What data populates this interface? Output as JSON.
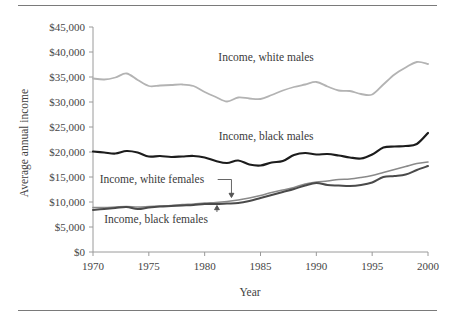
{
  "figure": {
    "name": "average-annual-income-by-race-and-sex-line-chart",
    "rule_color": "#7a7a7a"
  },
  "chart_data": {
    "type": "line",
    "title": "",
    "xlabel": "Year",
    "ylabel": "Average annual income",
    "xlim": [
      1970,
      2000
    ],
    "ylim": [
      0,
      45000
    ],
    "grid": false,
    "legend_position": "inline-annotations",
    "x_tick_labels": [
      "1970",
      "1975",
      "1980",
      "1985",
      "1990",
      "1995",
      "2000"
    ],
    "x_ticks": [
      1970,
      1975,
      1980,
      1985,
      1990,
      1995,
      2000
    ],
    "y_tick_labels": [
      "$0",
      "$5,000",
      "$10,000",
      "$15,000",
      "$20,000",
      "$25,000",
      "$30,000",
      "$35,000",
      "$40,000",
      "$45,000"
    ],
    "y_ticks": [
      0,
      5000,
      10000,
      15000,
      20000,
      25000,
      30000,
      35000,
      40000,
      45000
    ],
    "x": [
      1970,
      1971,
      1972,
      1973,
      1974,
      1975,
      1976,
      1977,
      1978,
      1979,
      1980,
      1981,
      1982,
      1983,
      1984,
      1985,
      1986,
      1987,
      1988,
      1989,
      1990,
      1991,
      1992,
      1993,
      1994,
      1995,
      1996,
      1997,
      1998,
      1999,
      2000
    ],
    "series": [
      {
        "name": "Income, white males",
        "color": "#b3b3b3",
        "width": 1.8,
        "label": "Income, white males",
        "values": [
          34700,
          34500,
          34900,
          35700,
          34400,
          33200,
          33300,
          33400,
          33500,
          33200,
          32000,
          31000,
          30100,
          30900,
          30700,
          30600,
          31400,
          32300,
          33000,
          33500,
          34000,
          33100,
          32300,
          32200,
          31600,
          31500,
          33500,
          35500,
          36900,
          38000,
          37600
        ]
      },
      {
        "name": "Income, black males",
        "color": "#1c1c1c",
        "width": 2.2,
        "label": "Income, black males",
        "values": [
          20100,
          19900,
          19700,
          20200,
          19900,
          19100,
          19200,
          19000,
          19100,
          19200,
          18900,
          18200,
          17800,
          18300,
          17500,
          17300,
          17900,
          18200,
          19400,
          19800,
          19500,
          19600,
          19300,
          18900,
          18700,
          19500,
          20900,
          21100,
          21200,
          21600,
          23800
        ]
      },
      {
        "name": "Income, white females",
        "color": "#8a8a8a",
        "width": 1.6,
        "label": "Income, white females",
        "values": [
          8900,
          8900,
          9000,
          9100,
          9000,
          9100,
          9200,
          9300,
          9500,
          9600,
          9800,
          9900,
          10100,
          10400,
          10800,
          11300,
          11900,
          12400,
          12900,
          13600,
          14000,
          14200,
          14500,
          14600,
          14900,
          15300,
          15900,
          16500,
          17100,
          17700,
          18000
        ]
      },
      {
        "name": "Income, black females",
        "color": "#4a4a4a",
        "width": 2.0,
        "label": "Income, black females",
        "values": [
          8400,
          8600,
          8800,
          9000,
          8600,
          8900,
          9100,
          9200,
          9300,
          9400,
          9600,
          9600,
          9700,
          9800,
          10200,
          10800,
          11400,
          12000,
          12600,
          13300,
          13800,
          13400,
          13300,
          13200,
          13400,
          13900,
          15000,
          15200,
          15500,
          16400,
          17200
        ]
      }
    ],
    "annotations": [
      {
        "id": "white-males-label",
        "text": "Income, white males",
        "x": 1985.5,
        "y": 38200
      },
      {
        "id": "black-males-label",
        "text": "Income, black males",
        "x": 1985.5,
        "y": 22500
      },
      {
        "id": "white-females-label",
        "text": "Income, white females",
        "x": 1970.6,
        "y": 13800,
        "leader_to": {
          "x": 1982.4,
          "y": 10900
        }
      },
      {
        "id": "black-females-label",
        "text": "Income, black females",
        "x": 1971.0,
        "y": 5800,
        "leader_to": {
          "x": 1981.1,
          "y": 9300
        }
      }
    ]
  }
}
